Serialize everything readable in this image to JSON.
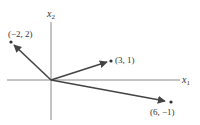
{
  "diagram": {
    "type": "vector-plane",
    "axes": {
      "x_label": "x",
      "x_sub": "1",
      "y_label": "x",
      "y_sub": "2"
    },
    "vectors": [
      {
        "label": "(−2, 2)",
        "x": -2,
        "y": 2
      },
      {
        "label": "(3, 1)",
        "x": 3,
        "y": 1
      },
      {
        "label": "(6, −1)",
        "x": 6,
        "y": -1
      }
    ],
    "colors": {
      "axis": "#888888",
      "vector": "#444444",
      "text": "#333333"
    }
  }
}
